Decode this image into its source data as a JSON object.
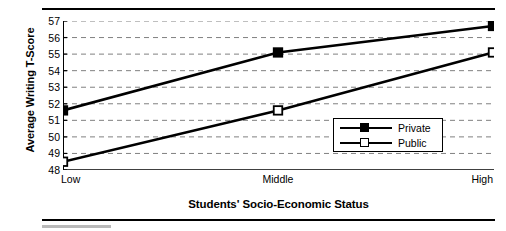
{
  "chart_data": {
    "type": "line",
    "title": "",
    "xlabel": "Students' Socio-Economic Status",
    "ylabel": "Average Writing T-Score",
    "categories": [
      "Low",
      "Middle",
      "High"
    ],
    "series": [
      {
        "name": "Private",
        "marker": "filled-square",
        "values": [
          51.6,
          55.1,
          56.7
        ]
      },
      {
        "name": "Public",
        "marker": "open-square",
        "values": [
          48.5,
          51.6,
          55.1
        ]
      }
    ],
    "ylim": [
      48,
      57
    ],
    "yticks": [
      57,
      56,
      55,
      54,
      53,
      52,
      51,
      50,
      49,
      48
    ],
    "ytick_labels": [
      "57",
      "56",
      "55",
      "54",
      "53",
      "52",
      "51",
      "50",
      "49",
      "48"
    ],
    "grid": "horizontal-dashed",
    "legend_position": "center-right",
    "line_color": "#000000",
    "grid_color": "#808080",
    "axis_color": "#000000",
    "background": "#ffffff"
  },
  "legend": {
    "entries": [
      {
        "label": "Private"
      },
      {
        "label": "Public"
      }
    ]
  },
  "figure": {
    "rule_color": "#000000",
    "accent_bar_color": "#b9b9b9"
  }
}
